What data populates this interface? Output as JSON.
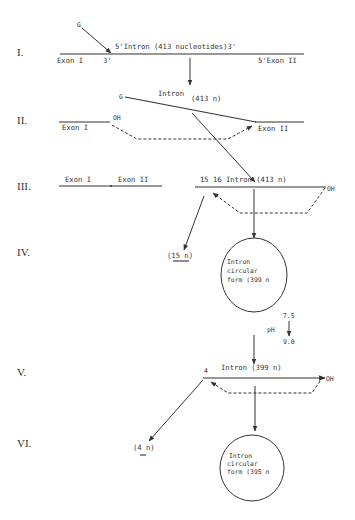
{
  "figure": {
    "steps": [
      {
        "numeral": "I.",
        "labels": {
          "guanosine": "G",
          "intron": "5'Intron (413 nucleotides)3'",
          "exon1": "Exon I",
          "exon1_end": "3'",
          "exon2": "5'Exon II"
        }
      },
      {
        "numeral": "II.",
        "labels": {
          "guanosine": "G",
          "intron": "Intron",
          "intron_size": "(413 n)",
          "exon1": "Exon I",
          "oh": "OH",
          "exon2": "Exon II"
        }
      },
      {
        "numeral": "III.",
        "labels": {
          "exon1": "Exon I",
          "exon2": "Exon II",
          "intron": "15 16 Intron (413 n)",
          "oh": "OH"
        }
      },
      {
        "numeral": "IV.",
        "labels": {
          "fragment": "(15 n)",
          "circle_line1": "Intron",
          "circle_line2": "circular",
          "circle_line3": "form (399 n"
        }
      },
      {
        "numeral": "V.",
        "labels": {
          "intron": "Intron (399 n)",
          "position": "4",
          "oh": "OH"
        }
      },
      {
        "numeral": "VI.",
        "labels": {
          "fragment": "(4 n)",
          "circle_line1": "Intron",
          "circle_line2": "circular",
          "circle_line3": "form (395 n"
        }
      }
    ],
    "ph_shift": {
      "label": "pH",
      "from": "7.5",
      "to": "9.0"
    }
  }
}
